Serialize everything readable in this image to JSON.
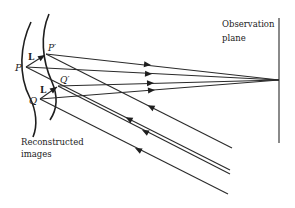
{
  "labels": {
    "P": "P",
    "P_prime": "P′",
    "Q": "Q",
    "Q_prime": "Q′",
    "L1": "L",
    "L2": "L",
    "observation_line1": "Observation",
    "observation_line2": "plane",
    "reconstructed_line1": "Reconstructed",
    "reconstructed_line2": "images"
  },
  "colors": {
    "ink": "#222222",
    "background": "#ffffff"
  }
}
